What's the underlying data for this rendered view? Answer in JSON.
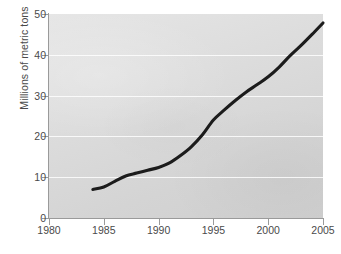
{
  "chart_data": {
    "type": "line",
    "title": "",
    "xlabel": "",
    "ylabel": "Millions of metric tons",
    "xlim": [
      1980,
      2005
    ],
    "ylim": [
      0,
      50
    ],
    "grid": true,
    "legend": false,
    "legend_position": "none",
    "line_color": "#1c1c1c",
    "panel_color": "#dcdcdc",
    "gridline_color": "#ffffff",
    "axis_color": "#9a9a9a",
    "tick_text_color": "#4a4a4a",
    "xticks": [
      "1980",
      "1985",
      "1990",
      "1995",
      "2000",
      "2005"
    ],
    "xtick_values": [
      1980,
      1985,
      1990,
      1995,
      2000,
      2005
    ],
    "yticks": [
      "0",
      "10",
      "20",
      "30",
      "40",
      "50"
    ],
    "ytick_values": [
      0,
      10,
      20,
      30,
      40,
      50
    ],
    "gridline_values": [
      10,
      20,
      30,
      40
    ],
    "x": [
      1984,
      1985,
      1986,
      1987,
      1988,
      1989,
      1990,
      1991,
      1992,
      1993,
      1994,
      1995,
      1996,
      1997,
      1998,
      1999,
      2000,
      2001,
      2002,
      2003,
      2004,
      2005
    ],
    "values": [
      7.0,
      7.6,
      9.0,
      10.3,
      11.0,
      11.7,
      12.4,
      13.5,
      15.3,
      17.5,
      20.4,
      24.0,
      26.5,
      28.8,
      30.9,
      32.7,
      34.6,
      37.0,
      39.8,
      42.3,
      45.0,
      47.8
    ],
    "series": [
      {
        "name": "",
        "x": [
          1984,
          1985,
          1986,
          1987,
          1988,
          1989,
          1990,
          1991,
          1992,
          1993,
          1994,
          1995,
          1996,
          1997,
          1998,
          1999,
          2000,
          2001,
          2002,
          2003,
          2004,
          2005
        ],
        "values": [
          7.0,
          7.6,
          9.0,
          10.3,
          11.0,
          11.7,
          12.4,
          13.5,
          15.3,
          17.5,
          20.4,
          24.0,
          26.5,
          28.8,
          30.9,
          32.7,
          34.6,
          37.0,
          39.8,
          42.3,
          45.0,
          47.8
        ]
      }
    ],
    "annotations": []
  },
  "caption": {
    "clipped_text": ""
  }
}
